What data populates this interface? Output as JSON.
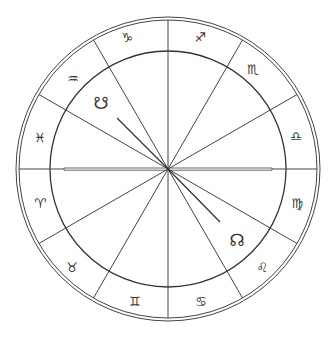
{
  "chart": {
    "title": "",
    "center": [
      168,
      169
    ],
    "outer_radius": 152,
    "outer_radius_inner_line": 149,
    "zodiac_inner_radius": 118,
    "axis_half_length": 104,
    "line_color": "#444444"
  },
  "zodiac_signs": [
    {
      "name": "capricorn",
      "glyph": "♑",
      "x": 127,
      "y": 37
    },
    {
      "name": "sagittarius",
      "glyph": "♐",
      "x": 200,
      "y": 37
    },
    {
      "name": "scorpio",
      "glyph": "♏",
      "x": 253,
      "y": 69
    },
    {
      "name": "libra",
      "glyph": "♎",
      "x": 296,
      "y": 136
    },
    {
      "name": "virgo",
      "glyph": "♍",
      "x": 297,
      "y": 203
    },
    {
      "name": "leo",
      "glyph": "♌",
      "x": 262,
      "y": 267
    },
    {
      "name": "cancer",
      "glyph": "♋",
      "x": 201,
      "y": 301
    },
    {
      "name": "gemini",
      "glyph": "♊",
      "x": 135,
      "y": 301
    },
    {
      "name": "taurus",
      "glyph": "♉",
      "x": 72,
      "y": 267
    },
    {
      "name": "aries",
      "glyph": "♈",
      "x": 40,
      "y": 203
    },
    {
      "name": "pisces",
      "glyph": "♓",
      "x": 40,
      "y": 137
    },
    {
      "name": "aquarius",
      "glyph": "♒",
      "x": 73,
      "y": 78
    }
  ],
  "nodes": {
    "south_node": {
      "glyph": "☋",
      "x": 101,
      "y": 103,
      "line_end": [
        117,
        118
      ]
    },
    "north_node": {
      "glyph": "☊",
      "x": 237,
      "y": 240,
      "line_end": [
        220,
        222
      ]
    }
  }
}
